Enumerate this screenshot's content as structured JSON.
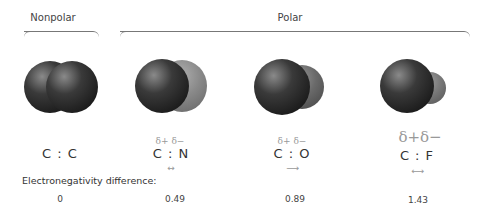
{
  "groups": {
    "nonpolar": "Nonpolar",
    "polar": "Polar"
  },
  "electronegativity_label": "Electronegativity difference:",
  "molecules": [
    {
      "formula": "C : C",
      "delta_plus": "",
      "delta_minus": "",
      "arrow": "",
      "difference": "0",
      "partner_color": "#333333"
    },
    {
      "formula": "C : N",
      "delta_plus": "δ+",
      "delta_minus": "δ−",
      "arrow": "↔",
      "difference": "0.49",
      "partner_color": "#8a8a8a"
    },
    {
      "formula": "C : O",
      "delta_plus": "δ+",
      "delta_minus": "δ−",
      "arrow": "⟶",
      "difference": "0.89",
      "partner_color": "#6a6a6a"
    },
    {
      "formula": "C : F",
      "delta_plus": "δ+",
      "delta_minus": "δ−",
      "arrow": "⟷",
      "difference": "1.43",
      "partner_color": "#7a7a7a"
    }
  ]
}
